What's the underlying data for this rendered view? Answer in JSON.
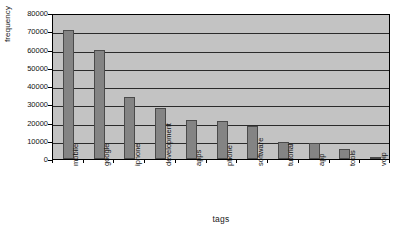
{
  "chart_data": {
    "type": "bar",
    "title": "",
    "xlabel": "tags",
    "ylabel": "frequency",
    "categories": [
      "mobile",
      "google",
      "iphone",
      "development",
      "apps",
      "phone",
      "software",
      "tutorial",
      "app",
      "tools",
      "voip"
    ],
    "values": [
      70500,
      59800,
      34000,
      28000,
      21500,
      21000,
      18000,
      9200,
      8800,
      5500,
      700
    ],
    "ylim": [
      0,
      80000
    ],
    "yticks": [
      0,
      10000,
      20000,
      30000,
      40000,
      50000,
      60000,
      70000,
      80000
    ],
    "ytick_labels": [
      "0",
      "10000",
      "20000",
      "30000",
      "40000",
      "50000",
      "60000",
      "70000",
      "80000"
    ],
    "grid": true,
    "grid_axis": "y",
    "legend": false,
    "legend_position": "none",
    "bar_color": "#848484",
    "bar_edge_color": "#4a4a4a",
    "plot_background": "#c3c3c3",
    "figure_background": "#ffffff",
    "axis_color": "#000000",
    "gridline_color": "#2b2b2b",
    "xtick_label_rotation": 90
  }
}
